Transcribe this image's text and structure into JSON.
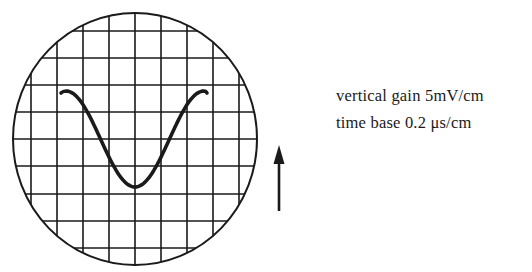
{
  "diagram": {
    "type": "oscilloscope-screen",
    "screen": {
      "shape": "circle",
      "center": [
        135,
        139
      ],
      "radius_x": 122,
      "radius_y": 126,
      "grid": {
        "vertical_lines_x": [
          31,
          57,
          83,
          109,
          135,
          161,
          187,
          213,
          239
        ],
        "horizontal_lines_y": [
          31,
          58,
          85,
          112,
          139,
          166,
          194,
          221,
          248
        ]
      },
      "trace": {
        "shape": "cosine",
        "description": "one full cycle from peak through trough back to peak",
        "start": [
          61,
          93
        ],
        "peak_left": [
          66,
          91
        ],
        "trough": [
          135,
          187
        ],
        "peak_right": [
          204,
          91
        ],
        "end": [
          207,
          93
        ]
      }
    },
    "arrow": {
      "direction": "up",
      "tip": [
        279,
        145
      ],
      "tail": [
        279,
        211
      ]
    },
    "labels": {
      "vertical_gain": "vertical gain 5mV/cm",
      "time_base": "time base 0.2 μs/cm"
    },
    "colors": {
      "ink": "#1a1a1a",
      "background": "#ffffff"
    }
  }
}
